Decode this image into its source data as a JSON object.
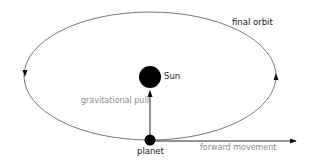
{
  "diagram": {
    "labels": {
      "final_orbit": "final orbit",
      "sun": "Sun",
      "gravitational_pull": "gravitational pull",
      "planet": "planet",
      "forward_movement": "forward movement"
    },
    "colors": {
      "orbit": "#555555",
      "bodies": "#000000",
      "dark_text": "#1a1a1a",
      "grey_text": "#8a8a8a"
    }
  }
}
